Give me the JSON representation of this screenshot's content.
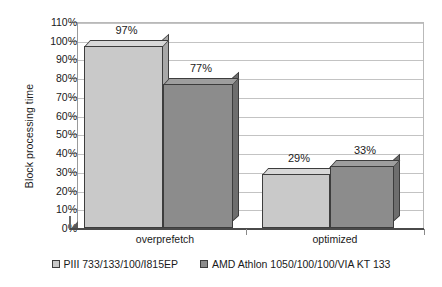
{
  "chart_data": {
    "type": "bar",
    "title": "",
    "xlabel": "",
    "ylabel": "Block processing time",
    "categories": [
      "overprefetch",
      "optimized"
    ],
    "ylim": [
      0,
      110
    ],
    "ytick_step": 10,
    "ytick_labels": [
      "0%",
      "10%",
      "20%",
      "30%",
      "40%",
      "50%",
      "60%",
      "70%",
      "80%",
      "90%",
      "100%",
      "110%"
    ],
    "grid": true,
    "legend_position": "bottom",
    "value_suffix": "%",
    "series": [
      {
        "name": "PIII 733/133/100/I815EP",
        "color": "#c9c9c9",
        "values": [
          97,
          29
        ],
        "labels": [
          "97%",
          "29%"
        ]
      },
      {
        "name": "AMD Athlon 1050/100/100/VIA KT 133",
        "color": "#8c8c8c",
        "values": [
          77,
          33
        ],
        "labels": [
          "77%",
          "33%"
        ]
      }
    ]
  },
  "axis": {
    "y_title": "Block processing time",
    "ticks": [
      {
        "label": "110%"
      },
      {
        "label": "100%"
      },
      {
        "label": "90%"
      },
      {
        "label": "80%"
      },
      {
        "label": "70%"
      },
      {
        "label": "60%"
      },
      {
        "label": "50%"
      },
      {
        "label": "40%"
      },
      {
        "label": "30%"
      },
      {
        "label": "20%"
      },
      {
        "label": "10%"
      },
      {
        "label": "0%"
      }
    ]
  },
  "categories": [
    {
      "label": "overprefetch"
    },
    {
      "label": "optimized"
    }
  ],
  "bars": [
    {
      "label": "97%",
      "series": "PIII 733/133/100/I815EP",
      "category": "overprefetch"
    },
    {
      "label": "77%",
      "series": "AMD Athlon 1050/100/100/VIA KT 133",
      "category": "overprefetch"
    },
    {
      "label": "29%",
      "series": "PIII 733/133/100/I815EP",
      "category": "optimized"
    },
    {
      "label": "33%",
      "series": "AMD Athlon 1050/100/100/VIA KT 133",
      "category": "optimized"
    }
  ],
  "legend": [
    {
      "label": "PIII 733/133/100/I815EP"
    },
    {
      "label": "AMD Athlon 1050/100/100/VIA KT 133"
    }
  ]
}
